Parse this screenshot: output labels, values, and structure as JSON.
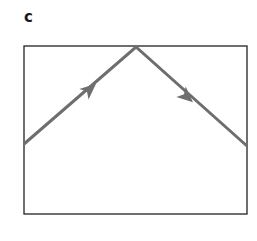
{
  "panel": {
    "label": "c"
  },
  "diagram": {
    "box": {
      "x": 24,
      "y": 46,
      "width": 223,
      "height": 168,
      "stroke": "#222222"
    },
    "ray": {
      "points": [
        [
          24,
          144
        ],
        [
          136,
          47
        ],
        [
          247,
          146
        ]
      ],
      "color": "#6e6e6e",
      "arrows": [
        {
          "direction": "up-right",
          "position": [
            92,
            90
          ]
        },
        {
          "direction": "down-right",
          "position": [
            186,
            96
          ]
        }
      ]
    }
  }
}
